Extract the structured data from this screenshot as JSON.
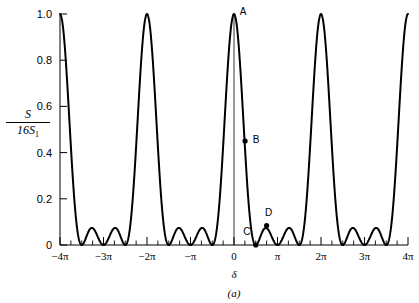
{
  "chart_data": {
    "type": "line",
    "title": "",
    "subtitle": "",
    "caption": "(a)",
    "xlabel": "δ",
    "ylabel_numerator": "S",
    "ylabel_denominator": "16S",
    "ylabel_denominator_sub": "1",
    "ylabel": "S/16S1",
    "xlim": [
      -12.566370614,
      12.566370614
    ],
    "ylim": [
      0,
      1.0
    ],
    "grid": false,
    "legend": null,
    "x_tick_values": [
      -12.566370614,
      -9.424777961,
      -6.283185307,
      -3.141592654,
      0,
      3.141592654,
      6.283185307,
      9.424777961,
      12.566370614
    ],
    "x_tick_labels": [
      "−4π",
      "−3π",
      "−2π",
      "−π",
      "0",
      "π",
      "2π",
      "3π",
      "4π"
    ],
    "y_tick_values": [
      0,
      0.2,
      0.4,
      0.6,
      0.8,
      1.0
    ],
    "y_tick_labels": [
      "0",
      "0.2",
      "0.4",
      "0.6",
      "0.8",
      "1.0"
    ],
    "x_minor_tick_count_per_interval": 3,
    "function": "N-slit interference: S/16S1 = (sin(2*delta)/(4*sin(delta/2)))^2, N=4",
    "slit_count": 4,
    "principal_maxima_x": [
      -12.566370614,
      -6.283185307,
      0,
      6.283185307,
      12.566370614
    ],
    "principal_maxima_y": [
      1.0,
      1.0,
      1.0,
      1.0,
      1.0
    ],
    "secondary_maxima_y_approx": [
      0.0845,
      0.0845
    ],
    "series": [
      {
        "name": "S/16S1",
        "color": "#000000",
        "line_width": 2.0,
        "values": []
      }
    ],
    "annotations": [
      {
        "label": "A",
        "x": 0.0,
        "y": 1.0,
        "marker": false,
        "label_dx": 9,
        "label_dy": -2
      },
      {
        "label": "B",
        "x": 0.8,
        "y": 0.45,
        "marker": true,
        "label_dx": 11,
        "label_dy": -1
      },
      {
        "label": "C",
        "x": 1.5708,
        "y": 0.0,
        "marker": true,
        "label_dx": -9,
        "label_dy": -13
      },
      {
        "label": "D",
        "x": 2.356,
        "y": 0.0845,
        "marker": true,
        "label_dx": 2,
        "label_dy": -12
      }
    ]
  },
  "axes": {
    "y_axis_line": true,
    "x_axis_line": true,
    "center_vertical_line": true,
    "frame": "left-and-bottom"
  }
}
